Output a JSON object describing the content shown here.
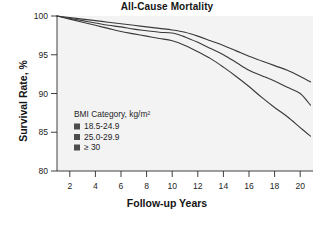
{
  "chart_data": {
    "type": "line",
    "title": "All-Cause Mortality",
    "xlabel": "Follow-up Years",
    "ylabel": "Survival Rate, %",
    "xlim": [
      1,
      21
    ],
    "ylim": [
      80,
      100
    ],
    "grid": false,
    "legend_position": "inside-left",
    "legend_title": "BMI Category, kg/m²",
    "xticks": [
      "2",
      "4",
      "6",
      "8",
      "10",
      "12",
      "14",
      "16",
      "18",
      "20"
    ],
    "xtick_values": [
      2,
      4,
      6,
      8,
      10,
      12,
      14,
      16,
      18,
      20
    ],
    "yticks": [
      "100",
      "95",
      "90",
      "85",
      "80"
    ],
    "ytick_values": [
      100,
      95,
      90,
      85,
      80
    ],
    "x": [
      1,
      2,
      3,
      4,
      5,
      6,
      7,
      8,
      9,
      10,
      11,
      12,
      13,
      14,
      15,
      16,
      17,
      18,
      19,
      20,
      20.8
    ],
    "series": [
      {
        "name": "18.5-24.9",
        "color": "#3a3a3a",
        "values": [
          100.0,
          99.8,
          99.6,
          99.4,
          99.2,
          99.0,
          98.8,
          98.6,
          98.4,
          98.2,
          97.9,
          97.4,
          96.8,
          96.2,
          95.5,
          94.8,
          94.2,
          93.6,
          93.0,
          92.2,
          91.5
        ]
      },
      {
        "name": "25.0-29.9",
        "color": "#3a3a3a",
        "values": [
          100.0,
          99.7,
          99.4,
          99.1,
          98.8,
          98.6,
          98.3,
          98.1,
          97.9,
          97.8,
          97.3,
          96.6,
          95.8,
          95.0,
          94.0,
          93.0,
          92.3,
          91.6,
          90.8,
          90.0,
          88.5
        ]
      },
      {
        "name": "≥ 30",
        "color": "#3a3a3a",
        "values": [
          100.0,
          99.6,
          99.2,
          98.8,
          98.4,
          98.0,
          97.7,
          97.4,
          97.1,
          96.8,
          96.2,
          95.4,
          94.5,
          93.4,
          92.2,
          90.9,
          89.5,
          88.2,
          87.0,
          85.6,
          84.5
        ]
      }
    ],
    "legend_entries": [
      {
        "label": "18.5-24.9",
        "swatch_color": "#4d4d4d"
      },
      {
        "label": "25.0-29.9",
        "swatch_color": "#4d4d4d"
      },
      {
        "label": "≥ 30",
        "swatch_color": "#4d4d4d"
      }
    ]
  },
  "colors": {
    "panel_background": "#f3f3f3",
    "figure_background": "#ffffff",
    "axis": "#2b2b2b",
    "curve": "#3a3a3a",
    "text": "#1a1a1a"
  }
}
